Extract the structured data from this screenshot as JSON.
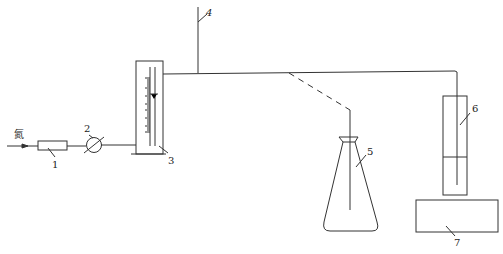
{
  "diagram": {
    "type": "apparatus schematic",
    "inlet_label": "氮",
    "components": [
      {
        "id": "1",
        "label": "1",
        "shape": "rectangle (flow resistor / drying tube)"
      },
      {
        "id": "2",
        "label": "2",
        "shape": "circle with diagonal (valve)"
      },
      {
        "id": "3",
        "label": "3",
        "shape": "graduated column with scale and marker"
      },
      {
        "id": "4",
        "label": "4",
        "shape": "vertical vent pipe"
      },
      {
        "id": "5",
        "label": "5",
        "shape": "conical flask"
      },
      {
        "id": "6",
        "label": "6",
        "shape": "test tube"
      },
      {
        "id": "7",
        "label": "7",
        "shape": "rectangular base (bath / stand)"
      }
    ],
    "connections": [
      {
        "from": "inlet",
        "to": "1",
        "style": "solid arrow"
      },
      {
        "from": "1",
        "to": "2",
        "style": "solid"
      },
      {
        "from": "2",
        "to": "3",
        "style": "solid"
      },
      {
        "from": "3",
        "to": "6",
        "style": "solid"
      },
      {
        "from": "main-line",
        "to": "4",
        "style": "solid"
      },
      {
        "from": "main-line",
        "to": "5",
        "style": "dashed"
      }
    ],
    "colors": {
      "stroke": "#333333",
      "background": "#ffffff"
    }
  }
}
